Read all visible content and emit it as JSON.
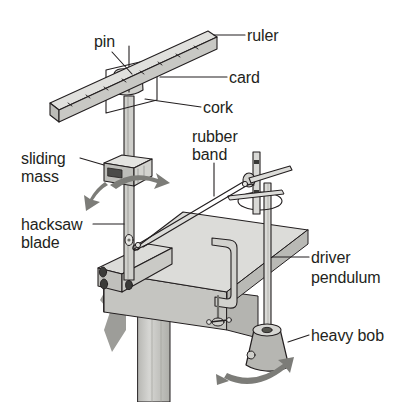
{
  "figure": {
    "background_color": "#ffffff",
    "ink_color": "#231f20",
    "fill_light": "#e2e2df",
    "fill_mid": "#c9c9c5",
    "fill_dark": "#a9a9a5",
    "fill_shadow": "#8e8e8a"
  },
  "labels": [
    {
      "id": "pin",
      "text": "pin",
      "x": 94,
      "y": 33,
      "align": "left"
    },
    {
      "id": "ruler",
      "text": "ruler",
      "x": 247,
      "y": 27,
      "align": "left"
    },
    {
      "id": "card",
      "text": "card",
      "x": 229,
      "y": 69,
      "align": "left"
    },
    {
      "id": "cork",
      "text": "cork",
      "x": 203,
      "y": 99,
      "align": "left"
    },
    {
      "id": "rubber",
      "text": "rubber",
      "x": 192,
      "y": 128,
      "align": "left"
    },
    {
      "id": "band",
      "text": "band",
      "x": 192,
      "y": 146,
      "align": "left"
    },
    {
      "id": "sliding",
      "text": "sliding",
      "x": 21,
      "y": 150,
      "align": "left"
    },
    {
      "id": "mass",
      "text": "mass",
      "x": 21,
      "y": 168,
      "align": "left"
    },
    {
      "id": "hacksaw",
      "text": "hacksaw",
      "x": 21,
      "y": 216,
      "align": "left"
    },
    {
      "id": "blade",
      "text": "blade",
      "x": 21,
      "y": 234,
      "align": "left"
    },
    {
      "id": "driver",
      "text": "driver",
      "x": 311,
      "y": 249,
      "align": "left"
    },
    {
      "id": "pendulum",
      "text": "pendulum",
      "x": 311,
      "y": 269,
      "align": "left"
    },
    {
      "id": "heavy-bob",
      "text": "heavy bob",
      "x": 311,
      "y": 327,
      "align": "left"
    }
  ],
  "parts": [
    {
      "id": "ruler",
      "name": "ruler"
    },
    {
      "id": "pin",
      "name": "pin"
    },
    {
      "id": "card",
      "name": "card"
    },
    {
      "id": "cork",
      "name": "cork"
    },
    {
      "id": "hacksaw-blade",
      "name": "hacksaw blade"
    },
    {
      "id": "sliding-mass",
      "name": "sliding mass"
    },
    {
      "id": "rubber-band",
      "name": "rubber band"
    },
    {
      "id": "driver-pendulum",
      "name": "driver pendulum"
    },
    {
      "id": "heavy-bob",
      "name": "heavy bob"
    },
    {
      "id": "bench",
      "name": "bench top"
    },
    {
      "id": "g-clamp",
      "name": "G clamp"
    },
    {
      "id": "stand-rod",
      "name": "retort stand rod"
    }
  ],
  "arrows": [
    {
      "id": "blade-oscillation",
      "type": "double-curved",
      "label": ""
    },
    {
      "id": "bob-swing",
      "type": "double-curved",
      "label": ""
    }
  ],
  "ruler_ticks": 9
}
